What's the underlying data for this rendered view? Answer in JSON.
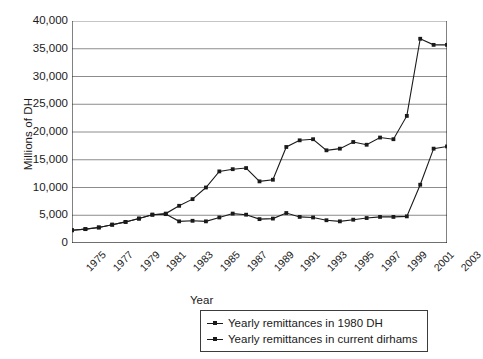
{
  "chart_data": {
    "type": "line",
    "title": "",
    "xlabel": "Year",
    "ylabel": "Millions of DH",
    "grid": true,
    "legend_position": "bottom",
    "xlim": [
      1975,
      2003
    ],
    "ylim": [
      0,
      40000
    ],
    "ytick_labels": [
      "40,000",
      "35,000",
      "30,000",
      "25,000",
      "20,000",
      "15,000",
      "10,000",
      "5,000",
      "0"
    ],
    "ytick_values": [
      40000,
      35000,
      30000,
      25000,
      20000,
      15000,
      10000,
      5000,
      0
    ],
    "x": [
      1975,
      1976,
      1977,
      1978,
      1979,
      1980,
      1981,
      1982,
      1983,
      1984,
      1985,
      1986,
      1987,
      1988,
      1989,
      1990,
      1991,
      1992,
      1993,
      1994,
      1995,
      1996,
      1997,
      1998,
      1999,
      2000,
      2001,
      2002,
      2003
    ],
    "xtick_labels": [
      "1975",
      "1977",
      "1979",
      "1981",
      "1983",
      "1985",
      "1987",
      "1989",
      "1991",
      "1993",
      "1995",
      "1997",
      "1999",
      "2001",
      "2003"
    ],
    "xtick_label_values": [
      1975,
      1977,
      1979,
      1981,
      1983,
      1985,
      1987,
      1989,
      1991,
      1993,
      1995,
      1997,
      1999,
      2001,
      2003
    ],
    "series": [
      {
        "name": "Yearly remittances in current dirhams",
        "marker": "square",
        "color": "#1a1a1a",
        "values": [
          2300,
          2500,
          2800,
          3300,
          3800,
          4400,
          5100,
          5300,
          6700,
          7900,
          10000,
          12900,
          13300,
          13500,
          11100,
          11400,
          17300,
          18500,
          18700,
          16700,
          17000,
          18200,
          17700,
          19000,
          18700,
          22900,
          36800,
          35700,
          35700
        ]
      },
      {
        "name": "Yearly remittances in 1980 DH",
        "marker": "square",
        "color": "#1a1a1a",
        "values": [
          2300,
          2500,
          2800,
          3300,
          3800,
          4400,
          5100,
          5200,
          3900,
          4000,
          3900,
          4600,
          5300,
          5100,
          4300,
          4400,
          5400,
          4700,
          4600,
          4100,
          3900,
          4200,
          4500,
          4700,
          4700,
          4800,
          10500,
          17000,
          17400
        ]
      }
    ],
    "legend_entries": [
      "Yearly remittances in 1980 DH",
      "Yearly remittances in current dirhams"
    ]
  }
}
